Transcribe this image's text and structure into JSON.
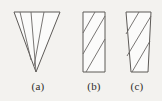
{
  "figure": {
    "background_color": "#f3f2ef",
    "stroke_color": "#5d5a57",
    "hatch_color": "#6a6764",
    "fill_color": "#fbfbfa",
    "text_color": "#2e2c2a",
    "panels": [
      {
        "id": "a",
        "caption": "(a)",
        "shape": "inverted-triangle",
        "description": "Downward pointing triangle with diagonal hatch lines",
        "hatch_line_count": 3,
        "outline_points": "14,12 60,12 36,72",
        "hatch_lines": [
          {
            "x1": 20,
            "y1": 12,
            "x2": 31,
            "y2": 60
          },
          {
            "x1": 31,
            "y1": 12,
            "x2": 36,
            "y2": 72
          },
          {
            "x1": 44,
            "y1": 12,
            "x2": 34,
            "y2": 66
          }
        ]
      },
      {
        "id": "b",
        "caption": "(b)",
        "shape": "rectangle",
        "description": "Upright rectangle with parallel diagonal hatch lines",
        "hatch_line_count": 3,
        "outline_points": "83,12 105,12 105,72 83,72",
        "hatch_lines": [
          {
            "x1": 83,
            "y1": 33,
            "x2": 95,
            "y2": 12
          },
          {
            "x1": 83,
            "y1": 54,
            "x2": 105,
            "y2": 16
          },
          {
            "x1": 86,
            "y1": 72,
            "x2": 105,
            "y2": 39
          }
        ]
      },
      {
        "id": "c",
        "caption": "(c)",
        "shape": "trapezoid",
        "description": "Trapezoid wider at top with parallel diagonal hatch lines",
        "hatch_line_count": 3,
        "outline_points": "126,12 151,12 148,72 131,72",
        "hatch_lines": [
          {
            "x1": 126,
            "y1": 34,
            "x2": 139,
            "y2": 12
          },
          {
            "x1": 127,
            "y1": 56,
            "x2": 151,
            "y2": 16
          },
          {
            "x1": 132,
            "y1": 72,
            "x2": 150,
            "y2": 41
          }
        ]
      }
    ]
  }
}
